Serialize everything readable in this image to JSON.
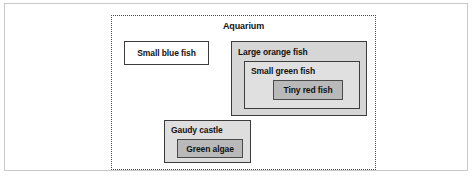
{
  "figure": {
    "type": "nested-containment-diagram",
    "outer_container": {
      "label": "Aquarium",
      "border_style": "dotted",
      "label_position": "top-center"
    },
    "nodes": [
      {
        "id": "small-blue-fish",
        "label": "Small blue fish",
        "fill": "#ffffff",
        "label_position": "center",
        "depth": 1,
        "children": []
      },
      {
        "id": "large-orange-fish",
        "label": "Large orange fish",
        "fill": "#d6d6d6",
        "label_position": "top-left",
        "depth": 1,
        "children": [
          {
            "id": "small-green-fish",
            "label": "Small green fish",
            "fill": "#e0e0e0",
            "label_position": "top-left",
            "depth": 2,
            "children": [
              {
                "id": "tiny-red-fish",
                "label": "Tiny red fish",
                "fill": "#b9b9b9",
                "label_position": "center",
                "depth": 3,
                "children": []
              }
            ]
          }
        ]
      },
      {
        "id": "gaudy-castle",
        "label": "Gaudy castle",
        "fill": "#dedede",
        "label_position": "top-left",
        "depth": 1,
        "children": [
          {
            "id": "green-algae",
            "label": "Green algae",
            "fill": "#b9b9b9",
            "label_position": "center",
            "depth": 2,
            "children": []
          }
        ]
      }
    ],
    "colors": {
      "text": "#121212",
      "box_border": "#3c3c3c",
      "container_border": "#4a4a4a",
      "page_background": "#ffffff",
      "frame_border": "#c9c9c9"
    }
  }
}
